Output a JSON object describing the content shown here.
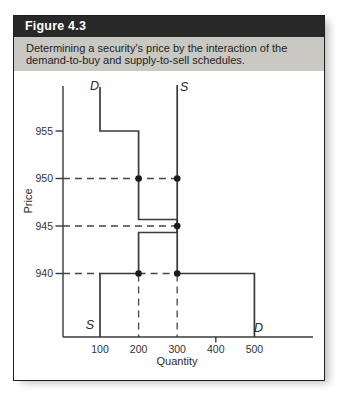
{
  "figure": {
    "label": "Figure 4.3",
    "caption_lines": [
      "Determining a security's price by the interaction of the",
      "demand-to-buy and supply-to-sell schedules."
    ]
  },
  "chart_data": {
    "type": "line",
    "subtype": "step-schedule",
    "title": "",
    "xlabel": "Quantity",
    "ylabel": "Price",
    "x_ticks": [
      100,
      200,
      300,
      400,
      500
    ],
    "y_ticks": [
      955,
      950,
      945,
      940
    ],
    "xlim": [
      0,
      650
    ],
    "ylim": [
      933,
      960
    ],
    "grid": false,
    "legend_position": "inline-curve-labels",
    "series": [
      {
        "name": "demand-to-buy",
        "label": "D",
        "points": [
          [
            100,
            955
          ],
          [
            200,
            955
          ],
          [
            200,
            945
          ],
          [
            300,
            945
          ],
          [
            300,
            940
          ],
          [
            500,
            940
          ]
        ]
      },
      {
        "name": "supply-to-sell",
        "label": "S",
        "points": [
          [
            100,
            940
          ],
          [
            200,
            940
          ],
          [
            200,
            945
          ],
          [
            300,
            945
          ]
        ]
      }
    ],
    "markers": [
      [
        200,
        950
      ],
      [
        300,
        950
      ],
      [
        300,
        945
      ],
      [
        200,
        940
      ],
      [
        300,
        940
      ]
    ],
    "equilibrium": {
      "quantity": 300,
      "price": 945
    },
    "guides": {
      "horizontal": [
        {
          "price": 950,
          "spans": [
            [
              null,
              300
            ]
          ]
        },
        {
          "price": 945,
          "spans": [
            [
              null,
              300
            ]
          ]
        },
        {
          "price": 940,
          "spans": [
            [
              null,
              100
            ],
            [
              200,
              300
            ]
          ]
        }
      ],
      "vertical": [
        {
          "quantity": 200
        },
        {
          "quantity": 300
        }
      ]
    }
  },
  "colors": {
    "header_bg": "#282828",
    "header_text": "#ffffff",
    "caption_bg": "#c9c8c3",
    "line": "#3a3a3a",
    "guide": "#474747",
    "dot": "#1b1b1b",
    "tick_text": "#333333"
  }
}
